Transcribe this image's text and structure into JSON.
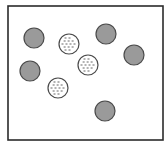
{
  "diagram": {
    "type": "particle-container",
    "colors": {
      "background": "#ffffff",
      "border": "#2b2b2b",
      "solid_fill": "#9a9a9a",
      "solid_stroke": "#4a4a4a",
      "striped_fill": "#ffffff",
      "striped_stroke": "#4a4a4a",
      "stripe": "#555555"
    },
    "container": {
      "x": 8,
      "y": 6,
      "width": 155,
      "height": 134
    },
    "particles": [
      {
        "kind": "solid",
        "cx": 34,
        "cy": 38,
        "r": 10
      },
      {
        "kind": "solid",
        "cx": 106,
        "cy": 34,
        "r": 10
      },
      {
        "kind": "solid",
        "cx": 134,
        "cy": 55,
        "r": 10
      },
      {
        "kind": "solid",
        "cx": 30,
        "cy": 71,
        "r": 10
      },
      {
        "kind": "solid",
        "cx": 105,
        "cy": 111,
        "r": 10
      },
      {
        "kind": "striped",
        "cx": 69,
        "cy": 44,
        "r": 10
      },
      {
        "kind": "striped",
        "cx": 88,
        "cy": 65,
        "r": 10
      },
      {
        "kind": "striped",
        "cx": 58,
        "cy": 88,
        "r": 10
      }
    ],
    "counts": {
      "solid": 5,
      "striped": 3
    }
  }
}
